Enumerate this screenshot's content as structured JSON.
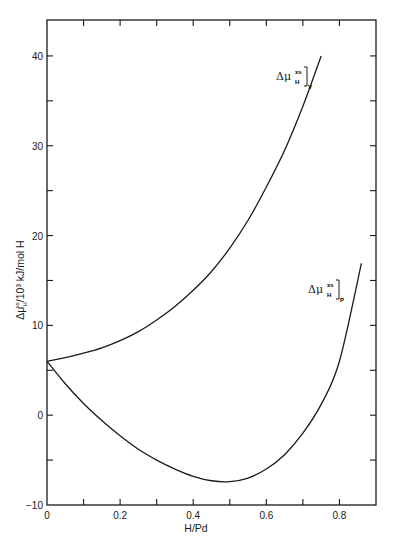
{
  "chart_data": {
    "type": "line",
    "title": "",
    "xlabel": "H/Pd",
    "ylabel": "Δμ_H^xs / 10³ kJ/mol H",
    "xlim": [
      0,
      0.9
    ],
    "ylim": [
      -10,
      44
    ],
    "grid": false,
    "legend": "inline curve labels",
    "x_ticks": [
      0,
      0.2,
      0.4,
      0.6,
      0.8
    ],
    "x_tick_labels": [
      "0",
      "0.2",
      "0.4",
      "0.6",
      "0.8"
    ],
    "x_minor_ticks": [
      0.1,
      0.3,
      0.5,
      0.7
    ],
    "y_ticks": [
      -10,
      0,
      10,
      20,
      30,
      40
    ],
    "y_tick_labels": [
      "−10",
      "0",
      "10",
      "20",
      "30",
      "40"
    ],
    "y_minor_ticks": [
      -5,
      5,
      15,
      25,
      35
    ],
    "series": [
      {
        "name": "Δμ_H^xs]_V",
        "label_main": "Δμ",
        "label_sub": "H",
        "label_sup": "xs",
        "label_bracket_sub": "V",
        "x": [
          0,
          0.05,
          0.1,
          0.15,
          0.2,
          0.25,
          0.3,
          0.35,
          0.4,
          0.45,
          0.5,
          0.55,
          0.6,
          0.65,
          0.7,
          0.75
        ],
        "values": [
          6.0,
          6.4,
          6.9,
          7.5,
          8.3,
          9.3,
          10.6,
          12.1,
          13.9,
          16.0,
          18.6,
          21.7,
          25.4,
          29.5,
          34.4,
          40.0
        ]
      },
      {
        "name": "Δμ_H^xs]_P",
        "label_main": "Δμ",
        "label_sub": "H",
        "label_sup": "xs",
        "label_bracket_sub": "P",
        "x": [
          0,
          0.05,
          0.1,
          0.15,
          0.2,
          0.25,
          0.3,
          0.35,
          0.4,
          0.45,
          0.5,
          0.55,
          0.6,
          0.65,
          0.7,
          0.75,
          0.8,
          0.86
        ],
        "values": [
          6.0,
          3.5,
          1.3,
          -0.6,
          -2.3,
          -3.8,
          -5.0,
          -6.0,
          -6.8,
          -7.3,
          -7.4,
          -7.0,
          -6.0,
          -4.4,
          -2.0,
          1.2,
          6.0,
          16.9
        ]
      }
    ]
  }
}
